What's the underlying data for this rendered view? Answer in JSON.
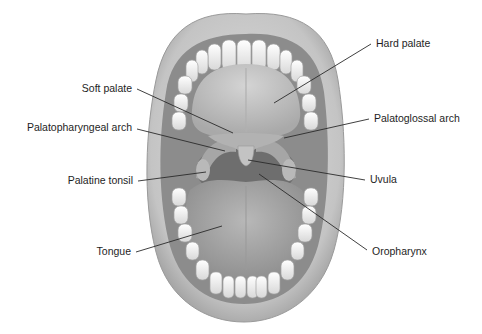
{
  "diagram": {
    "labels": [
      {
        "id": "hard-palate",
        "text": "Hard palate",
        "x": 376,
        "y": 47,
        "anchor": "start",
        "line": [
          [
            371,
            44
          ],
          [
            274,
            103
          ]
        ]
      },
      {
        "id": "soft-palate",
        "text": "Soft palate",
        "x": 132,
        "y": 92,
        "anchor": "end",
        "line": [
          [
            137,
            89
          ],
          [
            233,
            133
          ]
        ]
      },
      {
        "id": "palatopharyngeal-arch",
        "text": "Palatopharyngeal arch",
        "x": 132,
        "y": 131,
        "anchor": "end",
        "line": [
          [
            137,
            129
          ],
          [
            225,
            151
          ]
        ]
      },
      {
        "id": "palatoglossal-arch",
        "text": "Palatoglossal arch",
        "x": 374,
        "y": 122,
        "anchor": "start",
        "line": [
          [
            369,
            119
          ],
          [
            284,
            138
          ]
        ]
      },
      {
        "id": "palatine-tonsil",
        "text": "Palatine tonsil",
        "x": 133,
        "y": 184,
        "anchor": "end",
        "line": [
          [
            138,
            181
          ],
          [
            206,
            172
          ]
        ]
      },
      {
        "id": "uvula",
        "text": "Uvula",
        "x": 370,
        "y": 183,
        "anchor": "start",
        "line": [
          [
            365,
            180
          ],
          [
            248,
            160
          ]
        ]
      },
      {
        "id": "tongue",
        "text": "Tongue",
        "x": 131,
        "y": 255,
        "anchor": "end",
        "line": [
          [
            136,
            252
          ],
          [
            222,
            226
          ]
        ]
      },
      {
        "id": "oropharynx",
        "text": "Oropharynx",
        "x": 372,
        "y": 255,
        "anchor": "start",
        "line": [
          [
            367,
            250
          ],
          [
            259,
            174
          ]
        ]
      }
    ]
  },
  "colors": {
    "background": "#ffffff",
    "lip": "#c9c9c9",
    "lip_shadow": "#9a9a9a",
    "cavity": "#8f8f8f",
    "palate": "#bdbdbd",
    "teeth": "#f2f2f2",
    "tongue": "#a8a8a8",
    "pharynx": "#6e6e6e",
    "text": "#1e1e1e"
  }
}
